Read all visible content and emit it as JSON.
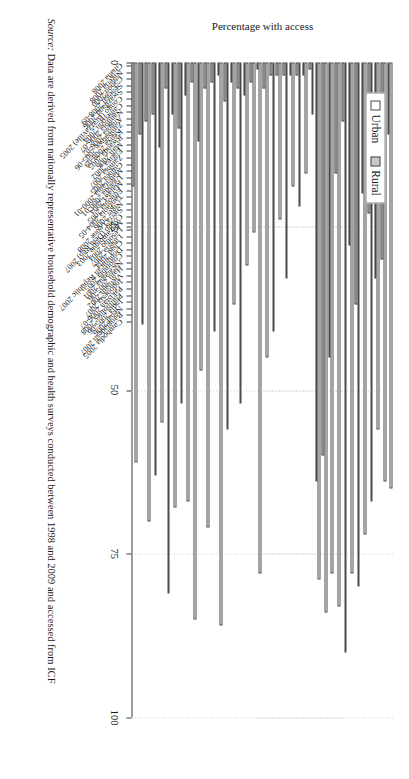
{
  "legend": {
    "position": "top-left",
    "items": [
      {
        "label": "Urban",
        "color": "#ffffff",
        "icon": "open-square-icon"
      },
      {
        "label": "Rural",
        "color": "#c8c8c8",
        "icon": "filled-square-icon"
      }
    ]
  },
  "axis": {
    "ylabel": "Percentage with access",
    "ticks": [
      "0",
      "25",
      "50",
      "75",
      "100"
    ]
  },
  "source": {
    "label": "Source:",
    "text": "Data are derived from nationally representative household demographic and health surveys conducted between 1998 and 2009 and accessed from ICF"
  },
  "chart_data": {
    "type": "bar",
    "title": "",
    "xlabel": "",
    "ylabel": "Percentage with access",
    "ylim": [
      0,
      100
    ],
    "yticks": [
      0,
      25,
      50,
      75,
      100
    ],
    "grid": true,
    "orientation": "vertical-categories-rotated",
    "legend_position": "top-left",
    "categories": [
      "Ghana 2008",
      "Nigeria 2008",
      "Gabon 2000",
      "Senegal 2008-09",
      "Swaziland 2006",
      "Congo (Brazzaville) 2005",
      "Cameroon 2004",
      "Namibia 2006-07",
      "Angola 2006-07",
      "Zimbabwe 2005-06",
      "Kenya 2008-09",
      "Rwanda 2005",
      "Mali 2006",
      "Eritrea 2002",
      "Zambia 2007",
      "Guinea 2005",
      "Mauritania 2000-01",
      "Uganda 2000-01",
      "Malawi 2004",
      "Ethiopia 2005",
      "Tanzania 2004-05",
      "Niger 2006",
      "Sierra Leone 2008",
      "Congo (Dem Rep) 2007",
      "Mozambique 2003",
      "Lesotho 2004",
      "Liberia 2007",
      "Chad 2004",
      "Dominican Republic 2007",
      "Colombia 2005",
      "Nicaragua 2001",
      "Haiti 2005-06",
      "Vietnam 2002",
      "Indonesia 2007",
      "Pakistan 2006-07",
      "Philippines 2008",
      "India 2005-06",
      "Nepal 2006",
      "Bangladesh 2007",
      "Cambodia 2005"
    ],
    "series": [
      {
        "name": "Urban",
        "color": "#ffffff",
        "values": [
          61,
          40,
          70,
          63,
          55,
          81,
          68,
          52,
          67,
          85,
          47,
          71,
          41,
          86,
          56,
          37,
          52,
          31,
          26,
          78,
          45,
          41,
          24,
          33,
          19,
          22,
          17,
          8,
          79,
          84,
          78,
          83,
          90,
          78,
          80,
          72,
          67,
          56,
          64,
          65
        ]
      },
      {
        "name": "Rural",
        "color": "#c8c8c8",
        "values": [
          19,
          11,
          9,
          8,
          13,
          4,
          8,
          10,
          5,
          3,
          12,
          4,
          3,
          2,
          6,
          3,
          4,
          5,
          3,
          1,
          4,
          2,
          2,
          2,
          2,
          2,
          2,
          1,
          64,
          60,
          45,
          17,
          9,
          28,
          37,
          20,
          23,
          33,
          30,
          11
        ]
      }
    ]
  }
}
